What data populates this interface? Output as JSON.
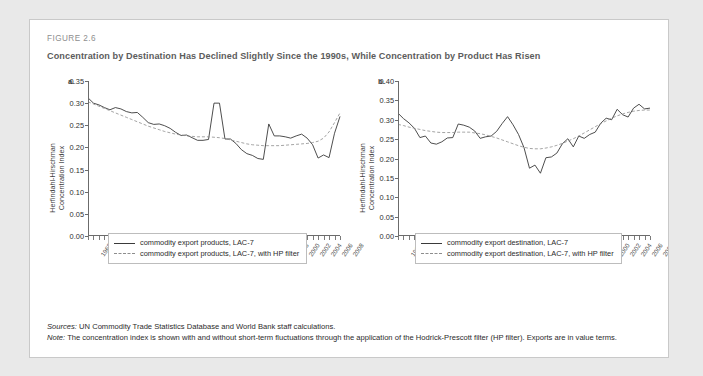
{
  "figure": {
    "number": "FIGURE 2.6",
    "title": "Concentration by Destination Has Declined Slightly Since the 1990s, While Concentration by Product Has Risen"
  },
  "notes": {
    "sources_label": "Sources:",
    "sources_text": " UN Commodity Trade Statistics Database and World Bank staff calculations.",
    "note_label": "Note:",
    "note_text": " The concentration index is shown with and without short-term fluctuations through the application of the Hodrick-Prescott filter (HP filter). Exports are in value terms."
  },
  "colors": {
    "series_solid": "#3a3a3a",
    "series_dashed": "#8d8d8d",
    "axis": "#6b6b6b",
    "card_border": "#c9c9c9",
    "page_background": "#e9e9e9",
    "title_text": "#5c5c5c"
  },
  "chart_data": [
    {
      "type": "line",
      "panel": "a.",
      "title": "",
      "xlabel": "",
      "ylabel": "Herfindahl-Hirschman Concentration Index",
      "ylim": [
        0.0,
        0.35
      ],
      "yticks": [
        "0.00",
        "0.05",
        "0.10",
        "0.15",
        "0.20",
        "0.25",
        "0.30",
        "0.35"
      ],
      "grid": false,
      "legend_position": "below",
      "x": [
        1962,
        1963,
        1964,
        1965,
        1966,
        1967,
        1968,
        1969,
        1970,
        1971,
        1972,
        1973,
        1974,
        1975,
        1976,
        1977,
        1978,
        1979,
        1980,
        1981,
        1982,
        1983,
        1984,
        1985,
        1986,
        1987,
        1988,
        1989,
        1990,
        1991,
        1992,
        1993,
        1994,
        1995,
        1996,
        1997,
        1998,
        1999,
        2000,
        2001,
        2002,
        2003,
        2004,
        2005,
        2006,
        2007,
        2008
      ],
      "xticks": [
        "1962",
        "1964",
        "1966",
        "1968",
        "1970",
        "1972",
        "1974",
        "1976",
        "1978",
        "1980",
        "1982",
        "1984",
        "1986",
        "1988",
        "1990",
        "1992",
        "1994",
        "1996",
        "1998",
        "2000",
        "2002",
        "2004",
        "2006",
        "2008"
      ],
      "series": [
        {
          "name": "commodity export products, LAC-7",
          "style": "solid",
          "values": [
            0.312,
            0.3,
            0.296,
            0.29,
            0.285,
            0.29,
            0.287,
            0.281,
            0.278,
            0.279,
            0.268,
            0.256,
            0.252,
            0.253,
            0.249,
            0.243,
            0.234,
            0.227,
            0.228,
            0.222,
            0.216,
            0.216,
            0.218,
            0.3,
            0.3,
            0.219,
            0.219,
            0.209,
            0.195,
            0.186,
            0.182,
            0.175,
            0.173,
            0.253,
            0.226,
            0.226,
            0.224,
            0.221,
            0.226,
            0.23,
            0.221,
            0.206,
            0.176,
            0.183,
            0.177,
            0.232,
            0.27,
            0.285,
            0.295
          ]
        },
        {
          "name": "commodity export products, LAC-7, with HP filter",
          "style": "dashed",
          "values": [
            0.303,
            0.298,
            0.293,
            0.288,
            0.283,
            0.278,
            0.273,
            0.268,
            0.263,
            0.258,
            0.253,
            0.248,
            0.244,
            0.24,
            0.236,
            0.233,
            0.23,
            0.228,
            0.226,
            0.225,
            0.224,
            0.224,
            0.224,
            0.223,
            0.222,
            0.22,
            0.217,
            0.214,
            0.211,
            0.208,
            0.206,
            0.205,
            0.204,
            0.204,
            0.204,
            0.204,
            0.205,
            0.206,
            0.207,
            0.208,
            0.209,
            0.211,
            0.214,
            0.221,
            0.235,
            0.256,
            0.278,
            0.292,
            0.296
          ]
        }
      ]
    },
    {
      "type": "line",
      "panel": "b.",
      "title": "",
      "xlabel": "",
      "ylabel": "Herfindahl-Hirschman Concentration Index",
      "ylim": [
        0.0,
        0.4
      ],
      "yticks": [
        "0.00",
        "0.05",
        "0.10",
        "0.15",
        "0.20",
        "0.25",
        "0.30",
        "0.35",
        "0.40"
      ],
      "grid": false,
      "legend_position": "below",
      "x": [
        1962,
        1963,
        1964,
        1965,
        1966,
        1967,
        1968,
        1969,
        1970,
        1971,
        1972,
        1973,
        1974,
        1975,
        1976,
        1977,
        1978,
        1979,
        1980,
        1981,
        1982,
        1983,
        1984,
        1985,
        1986,
        1987,
        1988,
        1989,
        1990,
        1991,
        1992,
        1993,
        1994,
        1995,
        1996,
        1997,
        1998,
        1999,
        2000,
        2001,
        2002,
        2003,
        2004,
        2005,
        2006,
        2007,
        2008
      ],
      "xticks": [
        "1962",
        "1964",
        "1966",
        "1968",
        "1970",
        "1972",
        "1974",
        "1976",
        "1978",
        "1980",
        "1982",
        "1984",
        "1986",
        "1988",
        "1990",
        "1992",
        "1994",
        "1996",
        "1998",
        "2000",
        "2002",
        "2004",
        "2006",
        "2008"
      ],
      "series": [
        {
          "name": "commodity export destination, LAC-7",
          "style": "solid",
          "values": [
            0.317,
            0.303,
            0.292,
            0.278,
            0.254,
            0.258,
            0.24,
            0.237,
            0.243,
            0.253,
            0.254,
            0.289,
            0.286,
            0.281,
            0.271,
            0.252,
            0.256,
            0.258,
            0.27,
            0.29,
            0.308,
            0.287,
            0.262,
            0.228,
            0.175,
            0.183,
            0.162,
            0.202,
            0.204,
            0.214,
            0.238,
            0.251,
            0.23,
            0.258,
            0.252,
            0.262,
            0.268,
            0.291,
            0.304,
            0.3,
            0.327,
            0.313,
            0.307,
            0.33,
            0.34,
            0.328,
            0.33
          ]
        },
        {
          "name": "commodity export destination, LAC-7, with HP filter",
          "style": "dashed",
          "values": [
            0.288,
            0.285,
            0.281,
            0.278,
            0.275,
            0.272,
            0.27,
            0.268,
            0.267,
            0.267,
            0.267,
            0.268,
            0.268,
            0.268,
            0.266,
            0.264,
            0.261,
            0.257,
            0.253,
            0.248,
            0.243,
            0.238,
            0.233,
            0.229,
            0.226,
            0.225,
            0.225,
            0.227,
            0.23,
            0.234,
            0.239,
            0.245,
            0.251,
            0.258,
            0.266,
            0.274,
            0.282,
            0.29,
            0.297,
            0.304,
            0.31,
            0.315,
            0.319,
            0.322,
            0.324,
            0.325,
            0.325
          ]
        }
      ]
    }
  ]
}
